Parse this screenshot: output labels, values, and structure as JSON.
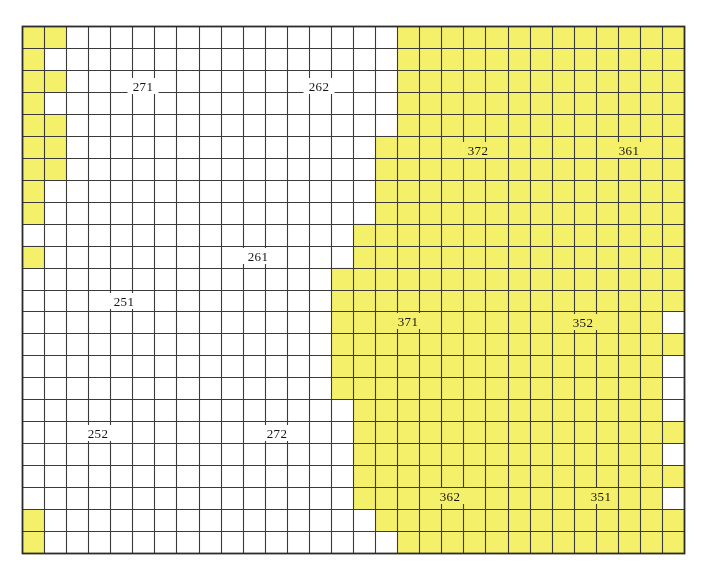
{
  "figure": {
    "kind": "grid-zone-map",
    "width": 706,
    "height": 574
  },
  "colors": {
    "page_background": "#ffffff",
    "cell_empty": "#ffffff",
    "cell_filled": "#f5f06a",
    "grid_line": "#3a3a38",
    "grid_border": "#2b2b29",
    "label_text": "#15130f"
  },
  "grid": {
    "origin_x": 22,
    "origin_y": 26,
    "cell_width": 22.07,
    "cell_height": 21.96,
    "columns": 30,
    "rows": 24,
    "line_width": 1.1,
    "border_width": 1.8,
    "label_gap": 9
  },
  "filled_cells": [
    [
      0,
      0
    ],
    [
      0,
      1
    ],
    [
      1,
      0
    ],
    [
      2,
      0
    ],
    [
      2,
      1
    ],
    [
      3,
      0
    ],
    [
      4,
      0
    ],
    [
      4,
      1
    ],
    [
      5,
      0
    ],
    [
      5,
      1
    ],
    [
      6,
      0
    ],
    [
      6,
      1
    ],
    [
      7,
      0
    ],
    [
      8,
      0
    ],
    [
      10,
      0
    ],
    [
      23,
      0
    ],
    [
      22,
      0
    ],
    [
      0,
      17
    ],
    [
      0,
      18
    ],
    [
      0,
      19
    ],
    [
      0,
      20
    ],
    [
      0,
      21
    ],
    [
      0,
      22
    ],
    [
      0,
      23
    ],
    [
      0,
      24
    ],
    [
      0,
      25
    ],
    [
      0,
      26
    ],
    [
      0,
      27
    ],
    [
      0,
      28
    ],
    [
      0,
      29
    ],
    [
      1,
      17
    ],
    [
      1,
      18
    ],
    [
      1,
      19
    ],
    [
      1,
      20
    ],
    [
      1,
      21
    ],
    [
      1,
      22
    ],
    [
      1,
      23
    ],
    [
      1,
      24
    ],
    [
      1,
      25
    ],
    [
      1,
      26
    ],
    [
      1,
      27
    ],
    [
      1,
      28
    ],
    [
      1,
      29
    ],
    [
      2,
      17
    ],
    [
      2,
      18
    ],
    [
      2,
      19
    ],
    [
      2,
      20
    ],
    [
      2,
      21
    ],
    [
      2,
      22
    ],
    [
      2,
      23
    ],
    [
      2,
      24
    ],
    [
      2,
      25
    ],
    [
      2,
      26
    ],
    [
      2,
      27
    ],
    [
      2,
      28
    ],
    [
      2,
      29
    ],
    [
      3,
      17
    ],
    [
      3,
      18
    ],
    [
      3,
      19
    ],
    [
      3,
      20
    ],
    [
      3,
      21
    ],
    [
      3,
      22
    ],
    [
      3,
      23
    ],
    [
      3,
      24
    ],
    [
      3,
      25
    ],
    [
      3,
      26
    ],
    [
      3,
      27
    ],
    [
      3,
      28
    ],
    [
      3,
      29
    ],
    [
      4,
      17
    ],
    [
      4,
      18
    ],
    [
      4,
      19
    ],
    [
      4,
      20
    ],
    [
      4,
      21
    ],
    [
      4,
      22
    ],
    [
      4,
      23
    ],
    [
      4,
      24
    ],
    [
      4,
      25
    ],
    [
      4,
      26
    ],
    [
      4,
      27
    ],
    [
      4,
      28
    ],
    [
      4,
      29
    ],
    [
      5,
      16
    ],
    [
      5,
      17
    ],
    [
      5,
      18
    ],
    [
      5,
      19
    ],
    [
      5,
      20
    ],
    [
      5,
      21
    ],
    [
      5,
      22
    ],
    [
      5,
      23
    ],
    [
      5,
      24
    ],
    [
      5,
      25
    ],
    [
      5,
      26
    ],
    [
      5,
      27
    ],
    [
      5,
      28
    ],
    [
      5,
      29
    ],
    [
      6,
      16
    ],
    [
      6,
      17
    ],
    [
      6,
      18
    ],
    [
      6,
      19
    ],
    [
      6,
      20
    ],
    [
      6,
      21
    ],
    [
      6,
      22
    ],
    [
      6,
      23
    ],
    [
      6,
      24
    ],
    [
      6,
      25
    ],
    [
      6,
      26
    ],
    [
      6,
      27
    ],
    [
      6,
      28
    ],
    [
      6,
      29
    ],
    [
      7,
      16
    ],
    [
      7,
      17
    ],
    [
      7,
      18
    ],
    [
      7,
      19
    ],
    [
      7,
      20
    ],
    [
      7,
      21
    ],
    [
      7,
      22
    ],
    [
      7,
      23
    ],
    [
      7,
      24
    ],
    [
      7,
      25
    ],
    [
      7,
      26
    ],
    [
      7,
      27
    ],
    [
      7,
      28
    ],
    [
      7,
      29
    ],
    [
      8,
      16
    ],
    [
      8,
      17
    ],
    [
      8,
      18
    ],
    [
      8,
      19
    ],
    [
      8,
      20
    ],
    [
      8,
      21
    ],
    [
      8,
      22
    ],
    [
      8,
      23
    ],
    [
      8,
      24
    ],
    [
      8,
      25
    ],
    [
      8,
      26
    ],
    [
      8,
      27
    ],
    [
      8,
      28
    ],
    [
      8,
      29
    ],
    [
      9,
      15
    ],
    [
      9,
      16
    ],
    [
      9,
      17
    ],
    [
      9,
      18
    ],
    [
      9,
      19
    ],
    [
      9,
      20
    ],
    [
      9,
      21
    ],
    [
      9,
      22
    ],
    [
      9,
      23
    ],
    [
      9,
      24
    ],
    [
      9,
      25
    ],
    [
      9,
      26
    ],
    [
      9,
      27
    ],
    [
      9,
      28
    ],
    [
      9,
      29
    ],
    [
      10,
      15
    ],
    [
      10,
      16
    ],
    [
      10,
      17
    ],
    [
      10,
      18
    ],
    [
      10,
      19
    ],
    [
      10,
      20
    ],
    [
      10,
      21
    ],
    [
      10,
      22
    ],
    [
      10,
      23
    ],
    [
      10,
      24
    ],
    [
      10,
      25
    ],
    [
      10,
      26
    ],
    [
      10,
      27
    ],
    [
      10,
      28
    ],
    [
      10,
      29
    ],
    [
      11,
      14
    ],
    [
      11,
      15
    ],
    [
      11,
      16
    ],
    [
      11,
      17
    ],
    [
      11,
      18
    ],
    [
      11,
      19
    ],
    [
      11,
      20
    ],
    [
      11,
      21
    ],
    [
      11,
      22
    ],
    [
      11,
      23
    ],
    [
      11,
      24
    ],
    [
      11,
      25
    ],
    [
      11,
      26
    ],
    [
      11,
      27
    ],
    [
      11,
      28
    ],
    [
      11,
      29
    ],
    [
      12,
      14
    ],
    [
      12,
      15
    ],
    [
      12,
      16
    ],
    [
      12,
      17
    ],
    [
      12,
      18
    ],
    [
      12,
      19
    ],
    [
      12,
      20
    ],
    [
      12,
      21
    ],
    [
      12,
      22
    ],
    [
      12,
      23
    ],
    [
      12,
      24
    ],
    [
      12,
      25
    ],
    [
      12,
      26
    ],
    [
      12,
      27
    ],
    [
      12,
      28
    ],
    [
      12,
      29
    ],
    [
      13,
      14
    ],
    [
      13,
      15
    ],
    [
      13,
      16
    ],
    [
      13,
      17
    ],
    [
      13,
      18
    ],
    [
      13,
      19
    ],
    [
      13,
      20
    ],
    [
      13,
      21
    ],
    [
      13,
      22
    ],
    [
      13,
      23
    ],
    [
      13,
      24
    ],
    [
      13,
      25
    ],
    [
      13,
      26
    ],
    [
      13,
      27
    ],
    [
      13,
      28
    ],
    [
      14,
      14
    ],
    [
      14,
      15
    ],
    [
      14,
      16
    ],
    [
      14,
      17
    ],
    [
      14,
      18
    ],
    [
      14,
      19
    ],
    [
      14,
      20
    ],
    [
      14,
      21
    ],
    [
      14,
      22
    ],
    [
      14,
      23
    ],
    [
      14,
      24
    ],
    [
      14,
      25
    ],
    [
      14,
      26
    ],
    [
      14,
      27
    ],
    [
      14,
      28
    ],
    [
      14,
      29
    ],
    [
      15,
      14
    ],
    [
      15,
      15
    ],
    [
      15,
      16
    ],
    [
      15,
      17
    ],
    [
      15,
      18
    ],
    [
      15,
      19
    ],
    [
      15,
      20
    ],
    [
      15,
      21
    ],
    [
      15,
      22
    ],
    [
      15,
      23
    ],
    [
      15,
      24
    ],
    [
      15,
      25
    ],
    [
      15,
      26
    ],
    [
      15,
      27
    ],
    [
      15,
      28
    ],
    [
      16,
      14
    ],
    [
      16,
      15
    ],
    [
      16,
      16
    ],
    [
      16,
      17
    ],
    [
      16,
      18
    ],
    [
      16,
      19
    ],
    [
      16,
      20
    ],
    [
      16,
      21
    ],
    [
      16,
      22
    ],
    [
      16,
      23
    ],
    [
      16,
      24
    ],
    [
      16,
      25
    ],
    [
      16,
      26
    ],
    [
      16,
      27
    ],
    [
      16,
      28
    ],
    [
      17,
      15
    ],
    [
      17,
      16
    ],
    [
      17,
      17
    ],
    [
      17,
      18
    ],
    [
      17,
      19
    ],
    [
      17,
      20
    ],
    [
      17,
      21
    ],
    [
      17,
      22
    ],
    [
      17,
      23
    ],
    [
      17,
      24
    ],
    [
      17,
      25
    ],
    [
      17,
      26
    ],
    [
      17,
      27
    ],
    [
      17,
      28
    ],
    [
      18,
      15
    ],
    [
      18,
      16
    ],
    [
      18,
      17
    ],
    [
      18,
      18
    ],
    [
      18,
      19
    ],
    [
      18,
      20
    ],
    [
      18,
      21
    ],
    [
      18,
      22
    ],
    [
      18,
      23
    ],
    [
      18,
      24
    ],
    [
      18,
      25
    ],
    [
      18,
      26
    ],
    [
      18,
      27
    ],
    [
      18,
      28
    ],
    [
      18,
      29
    ],
    [
      19,
      15
    ],
    [
      19,
      16
    ],
    [
      19,
      17
    ],
    [
      19,
      18
    ],
    [
      19,
      19
    ],
    [
      19,
      20
    ],
    [
      19,
      21
    ],
    [
      19,
      22
    ],
    [
      19,
      23
    ],
    [
      19,
      24
    ],
    [
      19,
      25
    ],
    [
      19,
      26
    ],
    [
      19,
      27
    ],
    [
      19,
      28
    ],
    [
      20,
      15
    ],
    [
      20,
      16
    ],
    [
      20,
      17
    ],
    [
      20,
      18
    ],
    [
      20,
      19
    ],
    [
      20,
      20
    ],
    [
      20,
      21
    ],
    [
      20,
      22
    ],
    [
      20,
      23
    ],
    [
      20,
      24
    ],
    [
      20,
      25
    ],
    [
      20,
      26
    ],
    [
      20,
      27
    ],
    [
      20,
      28
    ],
    [
      20,
      29
    ],
    [
      21,
      15
    ],
    [
      21,
      16
    ],
    [
      21,
      17
    ],
    [
      21,
      18
    ],
    [
      21,
      19
    ],
    [
      21,
      20
    ],
    [
      21,
      21
    ],
    [
      21,
      22
    ],
    [
      21,
      23
    ],
    [
      21,
      24
    ],
    [
      21,
      25
    ],
    [
      21,
      26
    ],
    [
      21,
      27
    ],
    [
      21,
      28
    ],
    [
      22,
      16
    ],
    [
      22,
      17
    ],
    [
      22,
      18
    ],
    [
      22,
      19
    ],
    [
      22,
      20
    ],
    [
      22,
      21
    ],
    [
      22,
      22
    ],
    [
      22,
      23
    ],
    [
      22,
      24
    ],
    [
      22,
      25
    ],
    [
      22,
      26
    ],
    [
      22,
      27
    ],
    [
      22,
      28
    ],
    [
      22,
      29
    ],
    [
      23,
      17
    ],
    [
      23,
      18
    ],
    [
      23,
      19
    ],
    [
      23,
      20
    ],
    [
      23,
      21
    ],
    [
      23,
      22
    ],
    [
      23,
      23
    ],
    [
      23,
      24
    ],
    [
      23,
      25
    ],
    [
      23,
      26
    ],
    [
      23,
      27
    ],
    [
      23,
      28
    ],
    [
      23,
      29
    ]
  ],
  "labels": [
    {
      "text": "271",
      "x": 143,
      "y": 86,
      "name": "zone-label-271"
    },
    {
      "text": "262",
      "x": 319,
      "y": 86,
      "name": "zone-label-262"
    },
    {
      "text": "372",
      "x": 478,
      "y": 150,
      "name": "zone-label-372"
    },
    {
      "text": "361",
      "x": 629,
      "y": 150,
      "name": "zone-label-361"
    },
    {
      "text": "261",
      "x": 258,
      "y": 256,
      "name": "zone-label-261"
    },
    {
      "text": "251",
      "x": 124,
      "y": 301,
      "name": "zone-label-251"
    },
    {
      "text": "371",
      "x": 408,
      "y": 321,
      "name": "zone-label-371"
    },
    {
      "text": "352",
      "x": 583,
      "y": 322,
      "name": "zone-label-352"
    },
    {
      "text": "252",
      "x": 98,
      "y": 433,
      "name": "zone-label-252"
    },
    {
      "text": "272",
      "x": 277,
      "y": 433,
      "name": "zone-label-272"
    },
    {
      "text": "362",
      "x": 450,
      "y": 496,
      "name": "zone-label-362"
    },
    {
      "text": "351",
      "x": 601,
      "y": 496,
      "name": "zone-label-351"
    }
  ]
}
